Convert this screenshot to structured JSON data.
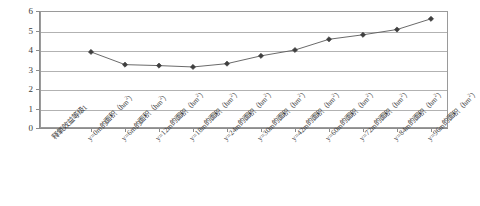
{
  "chart_data": {
    "type": "line",
    "title": "",
    "xlabel": "",
    "ylabel": "",
    "ylim": [
      0,
      6
    ],
    "ytick_values": [
      0,
      1,
      2,
      3,
      4,
      5,
      6
    ],
    "ytick_labels": [
      "0",
      "1",
      "2",
      "3",
      "4",
      "5",
      "6"
    ],
    "grid": true,
    "legend": false,
    "marker": "diamond",
    "line_color": "#595959",
    "marker_color": "#3f3f3f",
    "categories": [
      "释氧效益等级1",
      "y=0m的面积（hm²）",
      "y=6m的面积（hm²）",
      "y=12m的面积（hm²）",
      "y=18m的面积（hm²）",
      "y=24m的面积（hm²）",
      "y=30m的面积（hm²）",
      "y=42m的面积（hm²）",
      "y=60m的面积（hm²）",
      "y=72m的面积（hm²）",
      "y=84m的面积（hm²）",
      "y=96m的面积（hm²）"
    ],
    "category_parts": [
      {
        "base": "释氧效益等级1",
        "sup": "",
        "tail": ""
      },
      {
        "base": "y=0m的面积（hm",
        "sup": "2",
        "tail": "）"
      },
      {
        "base": "y=6m的面积（hm",
        "sup": "2",
        "tail": "）"
      },
      {
        "base": "y=12m的面积（hm",
        "sup": "2",
        "tail": "）"
      },
      {
        "base": "y=18m的面积（hm",
        "sup": "2",
        "tail": "）"
      },
      {
        "base": "y=24m的面积（hm",
        "sup": "2",
        "tail": "）"
      },
      {
        "base": "y=30m的面积（hm",
        "sup": "2",
        "tail": "）"
      },
      {
        "base": "y=42m的面积（hm",
        "sup": "2",
        "tail": "）"
      },
      {
        "base": "y=60m的面积（hm",
        "sup": "2",
        "tail": "）"
      },
      {
        "base": "y=72m的面积（hm",
        "sup": "2",
        "tail": "）"
      },
      {
        "base": "y=84m的面积（hm",
        "sup": "2",
        "tail": "）"
      },
      {
        "base": "y=96m的面积（hm",
        "sup": "2",
        "tail": "）"
      }
    ],
    "series": [
      {
        "name": "",
        "values": [
          null,
          3.9,
          3.25,
          3.2,
          3.13,
          3.3,
          3.7,
          4.0,
          4.55,
          4.78,
          5.05,
          5.6
        ]
      }
    ]
  }
}
